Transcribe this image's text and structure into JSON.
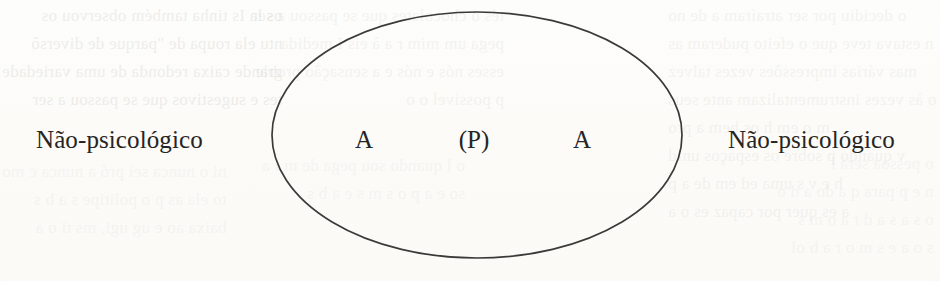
{
  "diagram": {
    "shape": "ellipse",
    "stroke_color": "#3b3a38",
    "background_color": "#fdfdfb",
    "labels": {
      "outer_left": "Não-psicológico",
      "outer_right": "Não-psicológico"
    },
    "inner_symbols": {
      "left": "A",
      "center": "(P)",
      "right": "A"
    }
  },
  "bleed_through": {
    "left_column": [
      "os la  Is tinha também observou os",
      "ntu ela  roupa de \"parque de diversõ",
      "grande caixa redonda de uma variedade",
      "tes e sugestivos que se passou a ser"
    ],
    "mid_column": [
      "tés o chocolates que se passou a ser",
      "pega um mim r a  à  eis  I  medida",
      "esses nós  e nós  e a sensação  proble",
      "p  possível o  o"
    ],
    "right_column": [
      "o decidiu por ser atraíram a  de no",
      "n  estava teve que o efeito puderam as",
      "mas várias impressões vezes  talvez",
      "o  às vezes instrumentalizam ante seus",
      "m o  em  h  os bem  a  pro",
      "v  quando  p  sobre os espaços  unid",
      "h  e  v  s  uma  ed  em  de a  p",
      "a  es  quer  por  capaz  es  o  a"
    ],
    "lower_left": [
      "ni  o  nunca sei  pró  a nunca  c  mo",
      "to ela  as  p  o  politipe  s  a  b  s",
      "baixa  ao  e  ug  ugi,  ms  ti  o  a"
    ],
    "lower_mid": [
      "o  l  quando  sou  pega  de  m  l  a",
      "so  e  a  p  o  s  m  s  e  a  b  s"
    ],
    "lower_right": [
      "o  pessoa  será  l",
      "n  e  p  para  q  a  do  a  d  o",
      "o  s  a  s  a  d  r  a  o  m  s",
      "s  o  a  e  s  m  o  r  a  b  ol"
    ]
  }
}
